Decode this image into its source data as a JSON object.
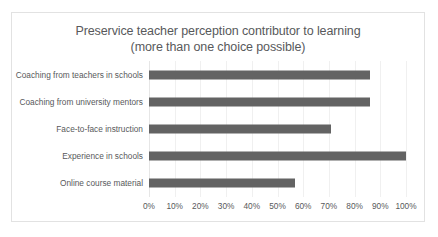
{
  "chart_data": {
    "type": "bar",
    "orientation": "horizontal",
    "title": "Preservice teacher perception contributor to learning (more than one choice possible)",
    "title_lines": [
      "Preservice teacher perception contributor to learning",
      "(more than one choice possible)"
    ],
    "categories": [
      "Coaching from teachers in schools",
      "Coaching from university mentors",
      "Face-to-face instruction",
      "Experience in schools",
      "Online course material"
    ],
    "values": [
      86,
      86,
      71,
      100,
      57
    ],
    "value_unit": "%",
    "xlabel": "",
    "ylabel": "",
    "xlim": [
      0,
      100
    ],
    "tick_labels": [
      "0%",
      "10%",
      "20%",
      "30%",
      "40%",
      "50%",
      "60%",
      "70%",
      "80%",
      "90%",
      "100%"
    ],
    "tick_values": [
      0,
      10,
      20,
      30,
      40,
      50,
      60,
      70,
      80,
      90,
      100
    ],
    "grid": true,
    "grid_axis": "x",
    "legend": false,
    "legend_position": "none",
    "series_color": "#636363",
    "gridline_color": "#f0f0f0",
    "text_color": "#58595b",
    "border_color": "#e2e2e2",
    "background": "#ffffff"
  }
}
